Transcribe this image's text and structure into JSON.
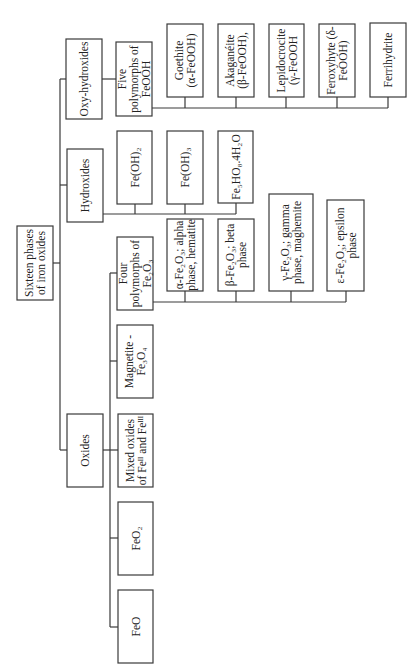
{
  "diagram": {
    "orientation": "rotated 90 degrees counter-clockwise",
    "colors": {
      "stroke": "#3a3a3a",
      "text": "#222222",
      "background": "#ffffff"
    },
    "root": {
      "id": "root",
      "lines": [
        "Sixteen phases",
        "of iron oxides"
      ],
      "box": [
        17,
        226,
        36,
        74
      ]
    },
    "categories": [
      {
        "id": "oxy-hydroxides",
        "lines": [
          "Oxy-hydroxides"
        ],
        "box": [
          66,
          39,
          36,
          80
        ],
        "children": [
          {
            "id": "five-polymorphs-feooh",
            "lines": [
              "Five",
              "polymorphs of",
              "FeOOH"
            ],
            "box": [
              116,
              42,
              36,
              74
            ],
            "children": [
              {
                "id": "goethite",
                "lines": [
                  "Goethite",
                  "(α-FeOOH)"
                ],
                "box": [
                  167,
                  24,
                  36,
                  73
                ]
              },
              {
                "id": "akaganeite",
                "lines": [
                  "Akaganéite",
                  "(β-FeOOH),"
                ],
                "box": [
                  218,
                  24,
                  36,
                  73
                ]
              },
              {
                "id": "lepidocrocite",
                "lines": [
                  "Lepidocrocite",
                  "(γ-FeOOH"
                ],
                "box": [
                  269,
                  24,
                  35,
                  73
                ]
              },
              {
                "id": "feroxyhyte",
                "lines": [
                  "Feroxyhyte (δ-",
                  "FeOOH)"
                ],
                "box": [
                  319,
                  24,
                  36,
                  73
                ]
              },
              {
                "id": "ferrihydrite",
                "lines": [
                  "Ferrihydrite"
                ],
                "box": [
                  370,
                  23,
                  36,
                  74
                ]
              }
            ]
          }
        ]
      },
      {
        "id": "hydroxides",
        "lines": [
          "Hydroxides"
        ],
        "box": [
          67,
          149,
          36,
          73
        ],
        "children": [
          {
            "id": "fe-oh-2",
            "lines": [
              "Fe(OH)₂"
            ],
            "box": [
              117,
              131,
              35,
              73
            ]
          },
          {
            "id": "fe-oh-3",
            "lines": [
              "Fe(OH)₃"
            ],
            "box": [
              167,
              131,
              36,
              73
            ]
          },
          {
            "id": "fe5ho8",
            "lines": [
              "Fe₅HO₈.4H₂O"
            ],
            "box": [
              218,
              131,
              35,
              72
            ]
          }
        ]
      },
      {
        "id": "oxides",
        "lines": [
          "Oxides"
        ],
        "box": [
          67,
          414,
          36,
          73
        ],
        "children": [
          {
            "id": "four-polymorphs-fe2o3",
            "lines": [
              "Four",
              "polymorphs of",
              "Fe₂O₃"
            ],
            "box": [
              117,
              237,
              36,
              73
            ],
            "children": [
              {
                "id": "alpha-fe2o3",
                "lines": [
                  "α-Fe₂O₃; alpha",
                  "phase, hematite"
                ],
                "box": [
                  167,
                  219,
                  36,
                  72
                ]
              },
              {
                "id": "beta-fe2o3",
                "lines": [
                  "β-Fe₂O₃; beta",
                  "phase"
                ],
                "box": [
                  218,
                  219,
                  36,
                  72
                ]
              },
              {
                "id": "gamma-fe2o3",
                "lines": [
                  "γ-Fe₂O₃; gamma",
                  "phase, maghemite"
                ],
                "box": [
                  269,
                  194,
                  44,
                  97
                ]
              },
              {
                "id": "epsilon-fe2o3",
                "lines": [
                  "ε-Fe₂O₃; epsilon",
                  "phase"
                ],
                "box": [
                  327,
                  200,
                  37,
                  91
                ]
              }
            ]
          },
          {
            "id": "magnetite",
            "lines": [
              "Magnetite -",
              "Fe₃O₄"
            ],
            "box": [
              117,
              325,
              36,
              73
            ]
          },
          {
            "id": "mixed-oxides",
            "lines": [
              "Mixed oxides",
              "of Feᴵᴵ and Feᴵᴵᴵ"
            ],
            "box": [
              118,
              414,
              35,
              73
            ]
          },
          {
            "id": "feo2",
            "lines": [
              "FeO₂"
            ],
            "box": [
              118,
              502,
              35,
              73
            ]
          },
          {
            "id": "feo",
            "lines": [
              "FeO"
            ],
            "box": [
              118,
              590,
              35,
              73
            ]
          }
        ]
      }
    ],
    "connectors": [
      {
        "id": "root-stub",
        "points": [
          [
            53,
            263
          ],
          [
            60,
            263
          ]
        ]
      },
      {
        "id": "main-trunk",
        "points": [
          [
            60,
            79
          ],
          [
            60,
            450
          ]
        ]
      },
      {
        "id": "to-oxyhydroxides",
        "points": [
          [
            60,
            79
          ],
          [
            66,
            79
          ]
        ]
      },
      {
        "id": "to-hydroxides",
        "points": [
          [
            60,
            185
          ],
          [
            67,
            185
          ]
        ]
      },
      {
        "id": "to-oxides",
        "points": [
          [
            60,
            450
          ],
          [
            67,
            450
          ]
        ]
      },
      {
        "id": "oxyhydroxides-to-five",
        "points": [
          [
            102,
            79
          ],
          [
            116,
            79
          ]
        ]
      },
      {
        "id": "feooh-bus",
        "points": [
          [
            152,
            108
          ],
          [
            388,
            108
          ]
        ]
      },
      {
        "id": "feooh-drop-1",
        "points": [
          [
            185,
            97
          ],
          [
            185,
            108
          ]
        ]
      },
      {
        "id": "feooh-drop-2",
        "points": [
          [
            236,
            97
          ],
          [
            236,
            108
          ]
        ]
      },
      {
        "id": "feooh-drop-3",
        "points": [
          [
            286,
            97
          ],
          [
            286,
            108
          ]
        ]
      },
      {
        "id": "feooh-drop-4",
        "points": [
          [
            337,
            97
          ],
          [
            337,
            108
          ]
        ]
      },
      {
        "id": "feooh-drop-5",
        "points": [
          [
            388,
            97
          ],
          [
            388,
            108
          ]
        ]
      },
      {
        "id": "hydroxides-bus",
        "points": [
          [
            103,
            214
          ],
          [
            236,
            214
          ]
        ]
      },
      {
        "id": "hyd-drop-1",
        "points": [
          [
            135,
            204
          ],
          [
            135,
            214
          ]
        ]
      },
      {
        "id": "hyd-drop-2",
        "points": [
          [
            185,
            204
          ],
          [
            185,
            214
          ]
        ]
      },
      {
        "id": "hyd-drop-3",
        "points": [
          [
            236,
            203
          ],
          [
            236,
            214
          ]
        ]
      },
      {
        "id": "oxides-stub",
        "points": [
          [
            103,
            450
          ],
          [
            110,
            450
          ]
        ]
      },
      {
        "id": "oxides-subtrunk",
        "points": [
          [
            110,
            273
          ],
          [
            110,
            627
          ]
        ]
      },
      {
        "id": "to-four",
        "points": [
          [
            110,
            273
          ],
          [
            117,
            273
          ]
        ]
      },
      {
        "id": "to-magnetite",
        "points": [
          [
            110,
            361
          ],
          [
            117,
            361
          ]
        ]
      },
      {
        "id": "to-mixed",
        "points": [
          [
            110,
            450
          ],
          [
            118,
            450
          ]
        ]
      },
      {
        "id": "to-feo2",
        "points": [
          [
            110,
            538
          ],
          [
            118,
            538
          ]
        ]
      },
      {
        "id": "to-feo",
        "points": [
          [
            110,
            627
          ],
          [
            118,
            627
          ]
        ]
      },
      {
        "id": "fe2o3-bus",
        "points": [
          [
            153,
            302
          ],
          [
            346,
            302
          ]
        ]
      },
      {
        "id": "fe2o3-drop-1",
        "points": [
          [
            185,
            291
          ],
          [
            185,
            302
          ]
        ]
      },
      {
        "id": "fe2o3-drop-2",
        "points": [
          [
            236,
            291
          ],
          [
            236,
            302
          ]
        ]
      },
      {
        "id": "fe2o3-drop-3",
        "points": [
          [
            291,
            291
          ],
          [
            291,
            302
          ]
        ]
      },
      {
        "id": "fe2o3-drop-4",
        "points": [
          [
            346,
            291
          ],
          [
            346,
            302
          ]
        ]
      }
    ]
  }
}
